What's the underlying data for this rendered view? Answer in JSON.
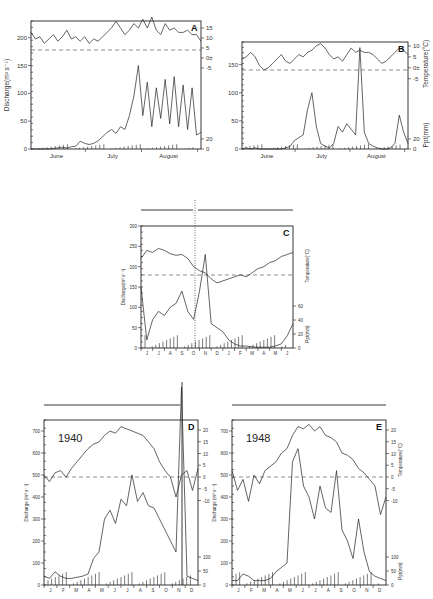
{
  "chart_data": [
    {
      "panel": "A",
      "type": "line",
      "title": "",
      "xlabel": "",
      "ylabel": "Discharge(m³ s⁻¹)",
      "y2label": "Temperature(°C) / Ppt(mm)",
      "x_ticks": [
        "June",
        "July",
        "August"
      ],
      "y_ticks": [
        0,
        50,
        100,
        150,
        200
      ],
      "ylim": [
        0,
        230
      ],
      "temp_ticks": [
        15,
        10,
        5,
        "0±",
        -5
      ],
      "ppt_ticks": [
        20,
        0
      ],
      "reference_line": "dashed at 0°C (≈150 on discharge axis)",
      "series": [
        {
          "name": "Temperature",
          "values": [
            8,
            5,
            6,
            3,
            5,
            7,
            4,
            6,
            9,
            5,
            6,
            4,
            6,
            3,
            5,
            4,
            6,
            8,
            10,
            13,
            10,
            7,
            9,
            12,
            10,
            14,
            10,
            15,
            9,
            7,
            12,
            9,
            10,
            8,
            8,
            9,
            7,
            7,
            4
          ]
        },
        {
          "name": "Discharge",
          "values": [
            0,
            0,
            0,
            0,
            0,
            1,
            2,
            3,
            2,
            4,
            5,
            14,
            10,
            8,
            10,
            15,
            22,
            30,
            35,
            28,
            40,
            35,
            60,
            95,
            150,
            60,
            120,
            40,
            110,
            55,
            125,
            45,
            130,
            40,
            115,
            35,
            110,
            25,
            30
          ]
        }
      ]
    },
    {
      "panel": "B",
      "type": "line",
      "ylabel": "Discharge(m³ s⁻¹)",
      "y2label": "Temperature(°C) / Ppt(mm)",
      "x_ticks": [
        "June",
        "July",
        "August"
      ],
      "y_ticks": [
        0,
        50,
        100,
        150
      ],
      "ylim": [
        0,
        190
      ],
      "temp_ticks": [
        10,
        5,
        "0±",
        -5
      ],
      "ppt_ticks": [
        20,
        0
      ],
      "series": [
        {
          "name": "Temperature",
          "values": [
            5,
            6,
            8,
            6,
            2,
            0,
            1,
            3,
            5,
            7,
            4,
            3,
            5,
            7,
            6,
            8,
            9,
            11,
            12,
            10,
            7,
            5,
            6,
            4,
            7,
            10,
            8,
            9,
            8,
            8,
            7,
            5,
            3,
            4,
            6,
            8,
            10,
            9,
            7
          ]
        },
        {
          "name": "Discharge",
          "values": [
            0,
            2,
            0,
            2,
            0,
            0,
            0,
            0,
            0,
            0,
            2,
            5,
            15,
            20,
            25,
            70,
            100,
            40,
            10,
            5,
            2,
            10,
            40,
            30,
            45,
            35,
            25,
            180,
            30,
            10,
            5,
            2,
            0,
            0,
            2,
            10,
            60,
            30,
            10
          ]
        }
      ]
    },
    {
      "panel": "C",
      "type": "line",
      "ylabel": "Discharge(m³ s⁻¹)",
      "y2label": "Temperature(°C) / Ppt(mm)",
      "x_ticks": [
        "J",
        "J",
        "A",
        "S",
        "O",
        "N",
        "D",
        "J",
        "F",
        "M",
        "A",
        "M",
        "J"
      ],
      "y_ticks": [
        0,
        50,
        100,
        150,
        200,
        250,
        300
      ],
      "ylim": [
        0,
        300
      ],
      "ppt_ticks": [
        60,
        40,
        20,
        0
      ],
      "series": [
        {
          "name": "Temperature",
          "values": [
            220,
            240,
            235,
            245,
            240,
            232,
            228,
            230,
            220,
            200,
            190,
            185,
            170,
            160,
            165,
            170,
            175,
            180,
            175,
            185,
            195,
            200,
            210,
            215,
            225,
            230,
            235
          ]
        },
        {
          "name": "Discharge",
          "values": [
            150,
            20,
            70,
            90,
            80,
            100,
            110,
            140,
            90,
            70,
            140,
            230,
            60,
            50,
            40,
            20,
            10,
            5,
            5,
            3,
            2,
            2,
            2,
            5,
            10,
            30,
            60
          ]
        }
      ]
    },
    {
      "panel": "D",
      "type": "line",
      "annotation": "1940",
      "ylabel": "Discharge (m³ s⁻¹)",
      "y2label": "Temperature (°C) / Ppt(mm)",
      "x_ticks": [
        "J",
        "F",
        "M",
        "A",
        "M",
        "J",
        "J",
        "A",
        "S",
        "O",
        "N",
        "D"
      ],
      "y_ticks": [
        0,
        100,
        200,
        300,
        400,
        500,
        600,
        700
      ],
      "ylim": [
        0,
        750
      ],
      "temp_ticks": [
        20,
        15,
        10,
        5,
        0,
        -5,
        -10
      ],
      "ppt_ticks": [
        100,
        50,
        0
      ],
      "series": [
        {
          "name": "Temperature",
          "values": [
            500,
            470,
            510,
            520,
            490,
            530,
            560,
            590,
            620,
            640,
            650,
            680,
            700,
            690,
            720,
            710,
            700,
            690,
            680,
            650,
            620,
            560,
            520,
            490,
            400,
            500,
            520,
            430,
            530
          ]
        },
        {
          "name": "Discharge",
          "values": [
            40,
            30,
            60,
            40,
            30,
            30,
            35,
            40,
            50,
            120,
            150,
            300,
            340,
            280,
            390,
            360,
            500,
            380,
            420,
            360,
            350,
            300,
            250,
            200,
            150,
            900,
            40,
            30,
            20
          ]
        }
      ]
    },
    {
      "panel": "E",
      "type": "line",
      "annotation": "1948",
      "ylabel": "Discharge (m³ s⁻¹)",
      "y2label": "Temperature (°C) / Ppt(mm)",
      "x_ticks": [
        "J",
        "F",
        "M",
        "A",
        "M",
        "J",
        "J",
        "A",
        "S",
        "O",
        "N",
        "D"
      ],
      "y_ticks": [
        0,
        100,
        200,
        300,
        400,
        500,
        600,
        700
      ],
      "ylim": [
        0,
        750
      ],
      "temp_ticks": [
        20,
        15,
        10,
        5,
        0,
        -5,
        -10
      ],
      "ppt_ticks": [
        100,
        50,
        0
      ],
      "series": [
        {
          "name": "Temperature",
          "values": [
            520,
            430,
            480,
            380,
            500,
            460,
            520,
            540,
            560,
            600,
            620,
            680,
            720,
            710,
            730,
            700,
            720,
            680,
            670,
            650,
            600,
            590,
            570,
            530,
            510,
            480,
            450,
            320,
            400
          ]
        },
        {
          "name": "Discharge",
          "values": [
            20,
            20,
            50,
            40,
            20,
            20,
            20,
            30,
            60,
            80,
            100,
            560,
            620,
            450,
            400,
            300,
            450,
            350,
            330,
            520,
            250,
            200,
            120,
            300,
            150,
            60,
            40,
            30,
            20
          ]
        }
      ]
    }
  ],
  "labels": {
    "A": "A",
    "B": "B",
    "C": "C",
    "D": "D",
    "E": "E",
    "year_D": "1940",
    "year_E": "1948",
    "discharge": "Discharge(m³ s⁻¹)",
    "discharge_sp": "Discharge (m³ s⁻¹)",
    "temperature": "Temperature(°C)",
    "temperature_sp": "Temperature (°C)",
    "ppt": "Ppt(mm)",
    "june": "June",
    "july": "July",
    "august": "August"
  }
}
